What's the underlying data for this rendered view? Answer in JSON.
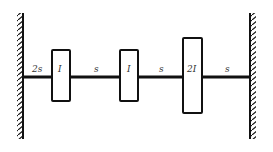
{
  "diagram": {
    "type": "torsional-system",
    "left_wall": {
      "label": "fixed-support-left"
    },
    "right_wall": {
      "label": "fixed-support-right"
    },
    "shafts": [
      {
        "label": "2s"
      },
      {
        "label": "s"
      },
      {
        "label": "s"
      },
      {
        "label": "s"
      }
    ],
    "discs": [
      {
        "label": "I"
      },
      {
        "label": "I"
      },
      {
        "label": "2I"
      }
    ]
  }
}
